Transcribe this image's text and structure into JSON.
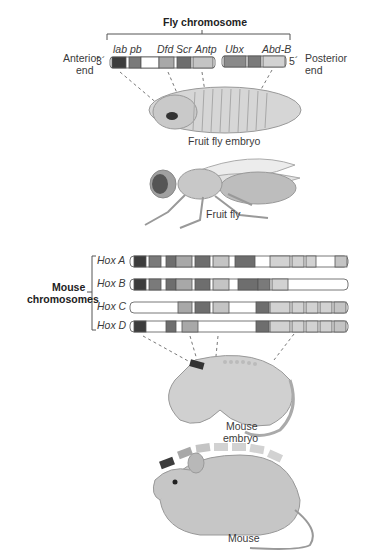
{
  "fly": {
    "title": "Fly chromosome",
    "anterior_label_1": "Anterior",
    "anterior_label_2": "end",
    "posterior_label_1": "Posterior",
    "posterior_label_2": "end",
    "three_prime": "3´",
    "five_prime": "5´",
    "genes": [
      "lab",
      "pb",
      "Dfd",
      "Scr",
      "Antp",
      "Ubx",
      "Abd-B"
    ],
    "embryo_label": "Fruit fly embryo",
    "adult_label": "Fruit fly"
  },
  "mouse": {
    "group_label_1": "Mouse",
    "group_label_2": "chromosomes",
    "clusters": [
      "Hox A",
      "Hox B",
      "Hox C",
      "Hox D"
    ],
    "embryo_label_1": "Mouse",
    "embryo_label_2": "embryo",
    "adult_label": "Mouse"
  },
  "colors": {
    "lab": "#3c3c3c",
    "pb": "#7a7a7a",
    "dfd": "#a8a8a8",
    "scr": "#6e6e6e",
    "antp": "#c4c4c4",
    "ubx": "#8a8a8a",
    "abdb": "#d2d2d2",
    "empty": "#ffffff",
    "outline": "#555555"
  }
}
